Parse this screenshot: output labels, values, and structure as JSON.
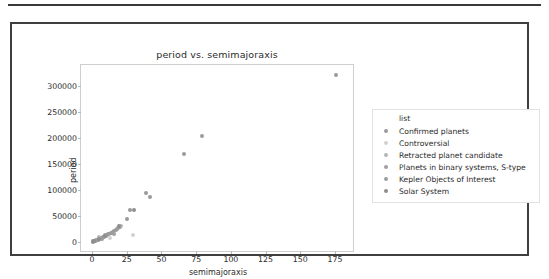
{
  "figure": {
    "background_color": "#ffffff",
    "frame_color": "#3f3f3f"
  },
  "chart_data": {
    "type": "scatter",
    "title": "period vs. semimajoraxis",
    "xlabel": "semimajoraxis",
    "ylabel": "period",
    "xlim": [
      -8,
      188
    ],
    "ylim": [
      -18000,
      340000
    ],
    "xticks": [
      0,
      25,
      50,
      75,
      100,
      125,
      150,
      175
    ],
    "xticklabels": [
      "0",
      "25",
      "50",
      "75",
      "100",
      "125",
      "150",
      "175"
    ],
    "yticks": [
      0,
      50000,
      100000,
      150000,
      200000,
      250000,
      300000
    ],
    "yticklabels": [
      "0",
      "50000",
      "100000",
      "150000",
      "200000",
      "250000",
      "300000"
    ],
    "grid": false,
    "legend_position": "right-outside",
    "legend_title": "list",
    "series": [
      {
        "name": "Confirmed planets",
        "color": "#9a9a9a",
        "points": [
          {
            "x": 0.6,
            "y": 300
          },
          {
            "x": 1.2,
            "y": 800
          },
          {
            "x": 1.8,
            "y": 1400
          },
          {
            "x": 2.4,
            "y": 1900
          },
          {
            "x": 3.1,
            "y": 2600
          },
          {
            "x": 3.9,
            "y": 3300
          },
          {
            "x": 4.6,
            "y": 4100
          },
          {
            "x": 5.4,
            "y": 5200
          },
          {
            "x": 6.2,
            "y": 6400
          },
          {
            "x": 7.1,
            "y": 7600
          },
          {
            "x": 8.0,
            "y": 8700
          },
          {
            "x": 8.9,
            "y": 9900
          },
          {
            "x": 9.8,
            "y": 11200
          },
          {
            "x": 10.6,
            "y": 12400
          },
          {
            "x": 11.5,
            "y": 13800
          },
          {
            "x": 12.4,
            "y": 14700
          },
          {
            "x": 13.3,
            "y": 16200
          },
          {
            "x": 14.2,
            "y": 17400
          },
          {
            "x": 15.1,
            "y": 18600
          },
          {
            "x": 16.0,
            "y": 19800
          },
          {
            "x": 17.0,
            "y": 21600
          },
          {
            "x": 18.0,
            "y": 23400
          },
          {
            "x": 19.0,
            "y": 26500
          },
          {
            "x": 20.0,
            "y": 28800
          },
          {
            "x": 25.4,
            "y": 44000
          },
          {
            "x": 27.2,
            "y": 61500
          },
          {
            "x": 38.5,
            "y": 93500
          },
          {
            "x": 42.0,
            "y": 86000
          },
          {
            "x": 66.5,
            "y": 169500
          },
          {
            "x": 79.5,
            "y": 203500
          },
          {
            "x": 176.0,
            "y": 321000
          }
        ]
      },
      {
        "name": "Controversial",
        "color": "#d2d2d2",
        "points": [
          {
            "x": 13.0,
            "y": 6200
          },
          {
            "x": 29.5,
            "y": 12600
          }
        ]
      },
      {
        "name": "Retracted planet candidate",
        "color": "#b5b5b5",
        "points": [
          {
            "x": 5.0,
            "y": 9800
          },
          {
            "x": 21.0,
            "y": 29200
          }
        ]
      },
      {
        "name": "Planets in binary systems, S-type",
        "color": "#a0a0a0",
        "points": [
          {
            "x": 9.0,
            "y": 12800
          },
          {
            "x": 15.5,
            "y": 15400
          }
        ]
      },
      {
        "name": "Kepler Objects of Interest",
        "color": "#9d9d9d",
        "points": [
          {
            "x": 2.0,
            "y": 2100
          },
          {
            "x": 6.8,
            "y": 4800
          }
        ]
      },
      {
        "name": "Solar System",
        "color": "#8e8e8e",
        "points": [
          {
            "x": 0.4,
            "y": 150
          },
          {
            "x": 1.5,
            "y": 700
          },
          {
            "x": 5.2,
            "y": 4300
          },
          {
            "x": 9.6,
            "y": 10700
          },
          {
            "x": 19.2,
            "y": 30700
          },
          {
            "x": 30.1,
            "y": 60200
          }
        ]
      }
    ]
  }
}
